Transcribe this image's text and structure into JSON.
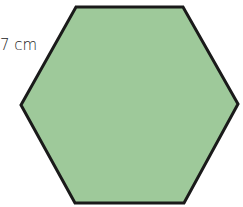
{
  "figure": {
    "shape": "regular-hexagon",
    "fill_color": "#9ec99a",
    "stroke_color": "#1a1a1a",
    "side_label": "7 cm"
  }
}
